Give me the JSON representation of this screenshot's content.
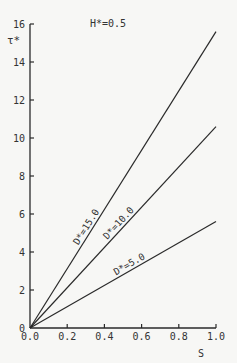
{
  "chart_data": {
    "type": "line",
    "title": "",
    "annotation": "H*=0.5",
    "xlabel": "S",
    "ylabel": "τ*",
    "xlim": [
      0.0,
      1.0
    ],
    "ylim": [
      0,
      16
    ],
    "x_ticks": [
      "0.0",
      "0.2",
      "0.4",
      "0.6",
      "0.8",
      "1.0"
    ],
    "y_ticks": [
      "0",
      "2",
      "4",
      "6",
      "8",
      "10",
      "12",
      "14",
      "16"
    ],
    "grid": false,
    "legend": "inline labels along lines",
    "series": [
      {
        "name": "D*=15.0",
        "x": [
          0.0,
          1.0
        ],
        "y": [
          0.0,
          15.6
        ]
      },
      {
        "name": "D*=10.0",
        "x": [
          0.0,
          1.0
        ],
        "y": [
          0.0,
          10.6
        ]
      },
      {
        "name": "D*=5.0",
        "x": [
          0.0,
          1.0
        ],
        "y": [
          0.0,
          5.6
        ]
      }
    ]
  },
  "colors": {
    "line": "#2a2a2a",
    "text": "#333333",
    "background": "#f7f7f5"
  }
}
